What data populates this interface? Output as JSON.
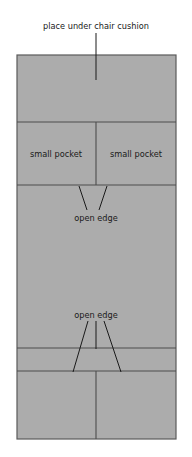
{
  "diagram": {
    "title": "place under chair cushion",
    "background_color": "#ffffff",
    "panel_fill_color": "#acacac",
    "line_color": "#4d4d4d",
    "outline_color": "#555555",
    "leader_line_color": "#1a1a1a",
    "text_color": "#1a1a1a",
    "panel": {
      "x": 17,
      "y": 55,
      "width": 159,
      "height": 384
    },
    "labels": {
      "title": "place under chair cushion",
      "pocket_left": "small pocket",
      "pocket_right": "small pocket",
      "open_edge_upper": "open edge",
      "open_edge_lower": "open edge"
    },
    "sections": [
      {
        "name": "top-panel",
        "y_top": 55,
        "y_bottom": 122,
        "split": false
      },
      {
        "name": "pocket-row",
        "y_top": 122,
        "y_bottom": 185,
        "split": true
      },
      {
        "name": "large-middle-panel",
        "y_top": 185,
        "y_bottom": 348,
        "split": false
      },
      {
        "name": "narrow-strip",
        "y_top": 348,
        "y_bottom": 371,
        "split": false
      },
      {
        "name": "bottom-panel",
        "y_top": 371,
        "y_bottom": 439,
        "split": true
      }
    ],
    "horizontal_dividers": [
      122,
      185,
      348,
      371
    ],
    "vertical_divider_x": 96
  }
}
